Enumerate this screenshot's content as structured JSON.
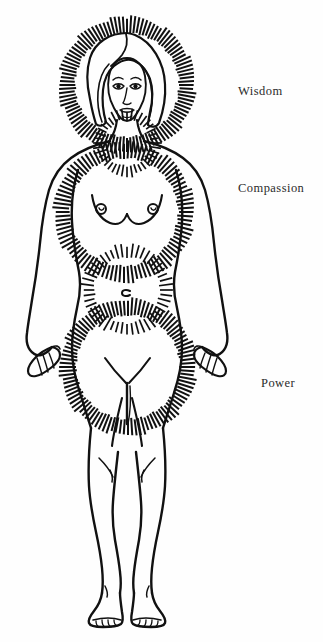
{
  "illustration": {
    "title": "Female figure with three radiant energy centers",
    "style": "black-and-white line drawing",
    "background_color": "#fefefe",
    "ink_color": "#111111",
    "figure": {
      "name": "standing-nude-female-figure",
      "pose": "frontal, standing, arms at sides, feet together"
    },
    "aura_centers": [
      {
        "id": "head",
        "name": "halo-head-aura",
        "label": "Wisdom",
        "center_x": 127,
        "center_y": 85,
        "inner_radius": 52,
        "outer_radius": 68,
        "ray_count": 104
      },
      {
        "id": "heart",
        "name": "heart-chest-aura",
        "label": "Compassion",
        "center_x": 124,
        "center_y": 212,
        "inner_radius": 54,
        "outer_radius": 70,
        "ray_count": 96
      },
      {
        "id": "belly",
        "name": "lower-abdomen-aura",
        "label": "Power",
        "center_x": 128,
        "center_y": 367,
        "inner_radius": 52,
        "outer_radius": 68,
        "ray_count": 100
      }
    ],
    "neck_aura": {
      "name": "neck-collar-aura",
      "center_x": 127,
      "center_y": 143,
      "inner_radius": 23,
      "outer_radius": 33,
      "ray_count": 40
    },
    "waist_aura": {
      "name": "waist-navel-aura",
      "center_x": 127,
      "center_y": 290,
      "inner_radius": 33,
      "outer_radius": 45,
      "ray_count": 48
    }
  },
  "labels": {
    "wisdom": "Wisdom",
    "compassion": "Compassion",
    "power": "Power"
  }
}
